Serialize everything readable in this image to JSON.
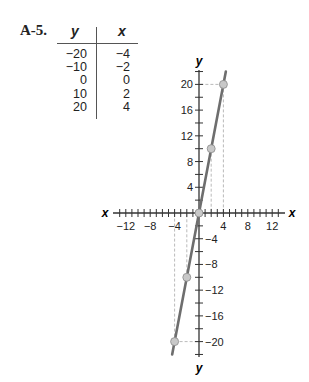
{
  "problem": {
    "label": "A-5."
  },
  "table": {
    "headers": [
      "y",
      "x"
    ],
    "rows": [
      {
        "y": "−20",
        "x": "−4"
      },
      {
        "y": "−10",
        "x": "−2"
      },
      {
        "y": "0",
        "x": "0"
      },
      {
        "y": "10",
        "x": "2"
      },
      {
        "y": "20",
        "x": "4"
      }
    ]
  },
  "colors": {
    "line": "#6e6e6e",
    "axis": "#333333",
    "point": "#c8c8c8",
    "guide": "#a8a8a8"
  },
  "chart_data": {
    "type": "line",
    "title": "",
    "xlabel": "x",
    "ylabel": "y",
    "x": [
      -4,
      -2,
      0,
      2,
      4
    ],
    "series": [
      {
        "name": "y = 5x",
        "values": [
          -20,
          -10,
          0,
          10,
          20
        ]
      }
    ],
    "x_ticks": [
      "−12",
      "−8",
      "−4",
      "4",
      "8",
      "12"
    ],
    "y_ticks": [
      "20",
      "16",
      "12",
      "8",
      "4",
      "−4",
      "−8",
      "−12",
      "−16",
      "−20"
    ],
    "xlim": [
      -14,
      14
    ],
    "ylim": [
      -22,
      22
    ],
    "grid": false,
    "legend": "none",
    "annotations": [
      "dashed guide lines from (4,20) and (−4,−20) to axes",
      "dashed verticals at x=2 and x=−2"
    ]
  }
}
